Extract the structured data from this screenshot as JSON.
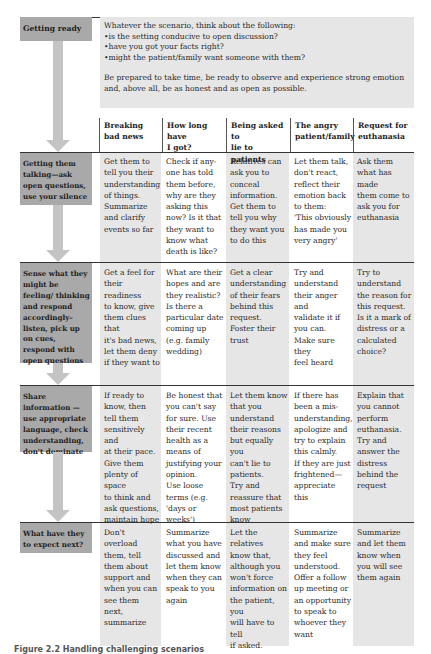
{
  "getting_ready": {
    "label": "Getting ready",
    "intro_line": "Whatever the scenario, think about the following:",
    "bullets": [
      "is the setting conducive to open discussion?",
      "have you got your facts right?",
      "might the patient/family want someone with them?"
    ],
    "closing": "Be prepared to take time, be ready to observe and experience strong emotion and, above all, be as honest and as open as possible."
  },
  "columns": [
    "Breaking\nbad news",
    "How long have\nI got?",
    "Being asked to\nlie to patients",
    "The angry\npatient/family",
    "Request for\neuthanasia"
  ],
  "rows": [
    {
      "label": "Getting them talking—ask open questions, use your silence",
      "cells": [
        "Get them to\ntell you their\nunderstanding\nof things.\nSummarize\nand clarify\nevents so far",
        "Check if any-\none has told\nthem before,\nwhy are they\nasking this\nnow? Is it that\nthey want to\nknow what\ndeath is like?",
        "Relatives can\nask you to\nconceal\ninformation.\nGet them to\ntell you why\nthey want you\nto do this",
        "Let them talk,\ndon't react,\nreflect their\nemotion back\nto them:\n'This obviously\nhas made you\nvery angry'",
        "Ask them\nwhat has made\nthem come to\nask you for\neuthanasia"
      ]
    },
    {
      "label": "Sense what they might be feeling/ thinking and respond accordingly–listen, pick up on cues, respond with open questions",
      "cells": [
        "Get a feel for\ntheir readiness\nto know, give\nthem clues that\nit's bad news,\nlet them deny\nif they want to",
        "What are their\nhopes and are\nthey realistic?\nIs there a\nparticular date\ncoming up\n(e.g. family\nwedding)",
        "Get a clear\nunderstanding\nof their fears\nbehind this\nrequest.\nFoster their\ntrust",
        "Try and\nunderstand\ntheir anger and\nvalidate it if\nyou can.\nMake sure they\nfeel heard",
        "Try to\nunderstand\nthe reason for\nthis request.\nIs it a mark of\ndistress or a\ncalculated\nchoice?"
      ]
    },
    {
      "label": "Share information —use appropriate language, check understanding, don't dominate",
      "cells": [
        "If ready to\nknow, then\ntell them\nsensitively and\nat their pace.\nGive them\nplenty of space\nto think and\nask questions,\nmaintain hope",
        "Be honest that\nyou can't say\nfor sure. Use\ntheir recent\nhealth as a\nmeans of\njustifying your\nopinion.\nUse loose\nterms (e.g.\n'days or weeks')",
        "Let them know\nthat you\nunderstand\ntheir reasons\nbut equally you\ncan't lie to\npatients.\nTry and\nreassure that\nmost patients\nknow",
        "If there has\nbeen a mis-\nunderstanding,\napologize and\ntry to explain\nthis calmly.\nIf they are just\nfrightened—\nappreciate this",
        "Explain that\nyou cannot\nperform\neuthanasia.\nTry and\nanswer the\ndistress\nbehind the\nrequest"
      ]
    },
    {
      "label": "What have they to expect next?",
      "cells": [
        "Don't overload\nthem, tell\nthem about\nsupport and\nwhen you can\nsee them next,\nsummarize",
        "Summarize\nwhat you have\ndiscussed and\nlet them know\nwhen they can\nspeak to you\nagain",
        "Let the relatives\nknow that,\nalthough you\nwon't force\ninformation on\nthe patient, you\nwill have to tell\nif asked.",
        "Summarize\nand make sure\nthey feel\nunderstood.\nOffer a follow\nup meeting or\nan opportunity\nto speak to\nwhoever they\nwant",
        "Summarize\nand let them\nknow when\nyou will see\nthem again"
      ]
    }
  ],
  "caption": "Figure 2.2  Handling challenging scenarios",
  "colors": {
    "label_box": "#a9a9a9",
    "arrow": "#c4c4c4",
    "shaded_column": "#e6e6e6",
    "rule": "#333333"
  }
}
